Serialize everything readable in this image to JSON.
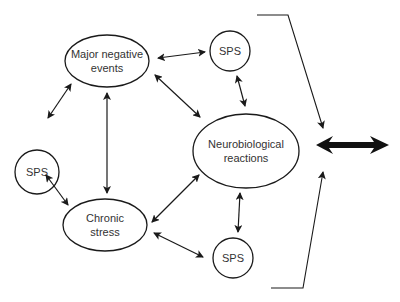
{
  "diagram": {
    "nodes": {
      "major_negative_events": {
        "line1": "Major negative",
        "line2": "events"
      },
      "neurobiological_reactions": {
        "line1": "Neurobiological",
        "line2": "reactions"
      },
      "chronic_stress": {
        "line1": "Chronic",
        "line2": "stress"
      },
      "sps_top": {
        "label": "SPS"
      },
      "sps_left": {
        "label": "SPS"
      },
      "sps_bottom": {
        "label": "SPS"
      }
    },
    "edges": [
      {
        "from": "major_negative_events",
        "to": "sps_top",
        "type": "bidirectional"
      },
      {
        "from": "major_negative_events",
        "to": "sps_left",
        "type": "bidirectional"
      },
      {
        "from": "major_negative_events",
        "to": "chronic_stress",
        "type": "bidirectional"
      },
      {
        "from": "major_negative_events",
        "to": "neurobiological_reactions",
        "type": "bidirectional"
      },
      {
        "from": "sps_top",
        "to": "neurobiological_reactions",
        "type": "bidirectional"
      },
      {
        "from": "sps_left",
        "to": "chronic_stress",
        "type": "bidirectional"
      },
      {
        "from": "chronic_stress",
        "to": "neurobiological_reactions",
        "type": "bidirectional"
      },
      {
        "from": "chronic_stress",
        "to": "sps_bottom",
        "type": "bidirectional"
      },
      {
        "from": "neurobiological_reactions",
        "to": "sps_bottom",
        "type": "bidirectional"
      },
      {
        "from": "bracket",
        "to": "outcome",
        "type": "bold-bidirectional"
      }
    ],
    "colors": {
      "stroke": "#1a1a1a",
      "text": "#333333",
      "background": "#ffffff"
    }
  }
}
